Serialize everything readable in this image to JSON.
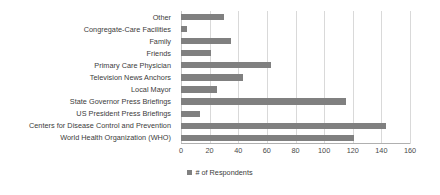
{
  "chart_data": {
    "type": "bar",
    "orientation": "horizontal",
    "title": "",
    "subtitle": "",
    "xlabel": "",
    "ylabel": "",
    "categories": [
      "Other",
      "Congregate-Care Facilities",
      "Family",
      "Friends",
      "Primary Care Physician",
      "Television News Anchors",
      "Local Mayor",
      "State Governor Press Briefings",
      "US President Press Briefings",
      "Centers for Disease Control and Prevention",
      "World Health Organization (WHO)"
    ],
    "series": [
      {
        "name": "# of Respondents",
        "values": [
          30,
          4,
          35,
          21,
          63,
          43,
          25,
          115,
          13,
          143,
          121
        ],
        "color": "#808080"
      }
    ],
    "xlim": [
      0,
      160
    ],
    "xticks": [
      0,
      20,
      40,
      60,
      80,
      100,
      120,
      140,
      160
    ],
    "xtick_labels": [
      "0",
      "20",
      "40",
      "60",
      "80",
      "100",
      "120",
      "140",
      "160"
    ],
    "grid": "vertical",
    "legend": {
      "position": "bottom",
      "entries": [
        {
          "label": "# of Respondents",
          "color": "#808080"
        }
      ]
    }
  },
  "legend": {
    "label": "# of Respondents"
  }
}
